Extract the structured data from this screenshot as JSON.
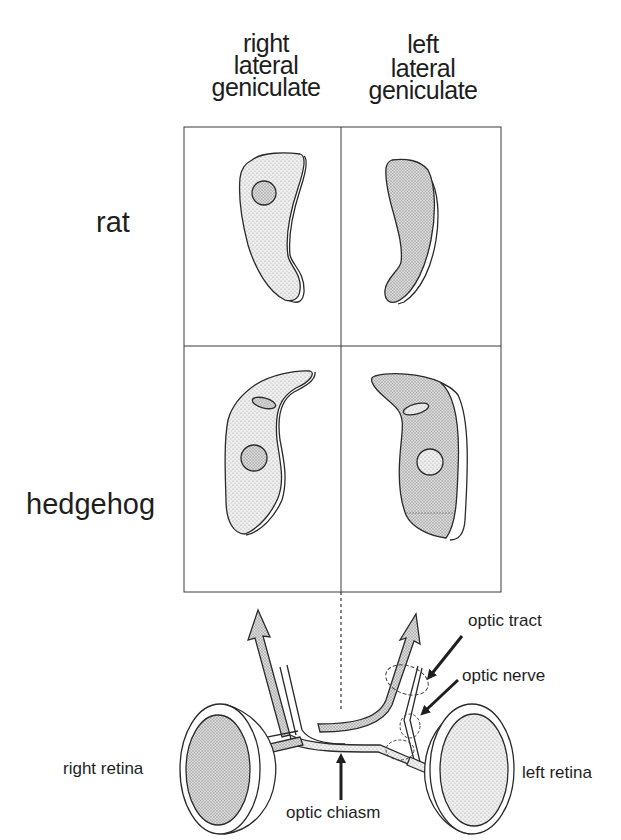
{
  "column_headers": [
    {
      "line1": "right",
      "line2": "lateral",
      "line3": "geniculate"
    },
    {
      "line1": "left",
      "line2": "lateral",
      "line3": "geniculate"
    }
  ],
  "row_headers": [
    "rat",
    "hedgehog"
  ],
  "annotations": {
    "optic_tract": "optic tract",
    "optic_nerve": "optic nerve",
    "optic_chiasm": "optic chiasm",
    "right_retina": "right retina",
    "left_retina": "left retina"
  },
  "colors": {
    "line": "#2a2a2a",
    "light_fill": "#e6e6e6",
    "dark_fill": "#cfcfcf",
    "background": "#ffffff"
  }
}
